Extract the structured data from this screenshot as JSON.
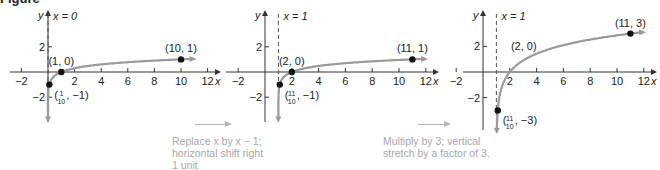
{
  "figure": {
    "label": "Figure"
  },
  "chart_data": [
    {
      "type": "line",
      "title": "",
      "function": "y = log x",
      "xlabel": "x",
      "ylabel": "y",
      "xlim": [
        -3,
        12.5
      ],
      "ylim": [
        -3.3,
        3.5
      ],
      "x_ticks": [
        -2,
        2,
        4,
        6,
        8,
        10,
        12
      ],
      "y_ticks": [
        2,
        -2
      ],
      "asymptote": {
        "x": 0,
        "label": "x = 0"
      },
      "grid": false,
      "points": [
        {
          "x": 0.1,
          "y": -1,
          "label_num": "1",
          "label_den": "10",
          "label_rest": ", −1)"
        },
        {
          "x": 1,
          "y": 0,
          "label": "(1, 0)"
        },
        {
          "x": 10,
          "y": 1,
          "label": "(10, 1)"
        }
      ],
      "curve": {
        "shift": 0,
        "scale": 1,
        "x_end": 10.8
      }
    },
    {
      "type": "line",
      "title": "",
      "function": "y = log(x − 1)",
      "xlabel": "x",
      "ylabel": "y",
      "xlim": [
        -3,
        12.5
      ],
      "ylim": [
        -3.3,
        3.5
      ],
      "x_ticks": [
        -2,
        2,
        4,
        6,
        8,
        10,
        12
      ],
      "y_ticks": [
        2,
        -2
      ],
      "asymptote": {
        "x": 1,
        "label": "x = 1"
      },
      "grid": false,
      "points": [
        {
          "x": 1.1,
          "y": -1,
          "label_num": "11",
          "label_den": "10",
          "label_rest": ", −1)"
        },
        {
          "x": 2,
          "y": 0,
          "label": "(2, 0)"
        },
        {
          "x": 11,
          "y": 1,
          "label": "(11, 1)"
        }
      ],
      "curve": {
        "shift": 1,
        "scale": 1,
        "x_end": 11.8
      }
    },
    {
      "type": "line",
      "title": "",
      "function": "y = 3 log(x − 1)",
      "xlabel": "x",
      "ylabel": "y",
      "xlim": [
        -3,
        12.5
      ],
      "ylim": [
        -3.6,
        3.5
      ],
      "x_ticks": [
        -2,
        2,
        4,
        6,
        8,
        10,
        12
      ],
      "y_ticks": [
        2,
        -2
      ],
      "asymptote": {
        "x": 1,
        "label": "x = 1"
      },
      "grid": false,
      "points": [
        {
          "x": 1.1,
          "y": -3,
          "label_num": "11",
          "label_den": "10",
          "label_rest": ", −3)"
        },
        {
          "x": 2,
          "y": 0,
          "label": "(2, 0)",
          "no_dot": true
        },
        {
          "x": 11,
          "y": 3,
          "label": "(11, 3)"
        }
      ],
      "curve": {
        "shift": 1,
        "scale": 3,
        "x_end": 11.8
      }
    }
  ],
  "captions": [
    {
      "lines": [
        "Replace x by x − 1;",
        "horizontal shift right",
        "1 unit"
      ]
    },
    {
      "lines": [
        "Multiply by 3; vertical",
        "stretch by a factor of 3."
      ]
    }
  ],
  "colors": {
    "axis": "#333333",
    "curve": "#9a9a9a",
    "point": "#111111",
    "caption": "#a8a8a8",
    "asymptote": "#555555"
  }
}
